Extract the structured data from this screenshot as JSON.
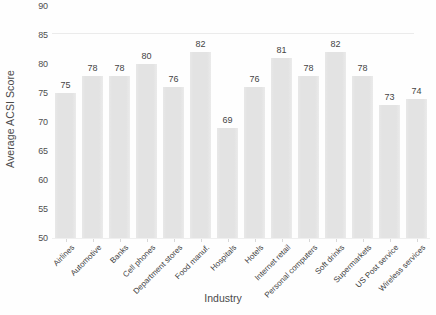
{
  "chart_data": {
    "type": "bar",
    "title": "",
    "xlabel": "Industry",
    "ylabel": "Average ACSI Score",
    "ylim": [
      50,
      90
    ],
    "yticks": [
      50,
      55,
      60,
      65,
      70,
      75,
      80,
      85,
      90
    ],
    "grid": false,
    "legend": null,
    "bar_color": "#e3e3e3",
    "data_labels": true,
    "xtick_rotation": -45,
    "categories": [
      "Airlines",
      "Automotive",
      "Banks",
      "Cell phones",
      "Department stores",
      "Food manuf.",
      "Hospitals",
      "Hotels",
      "Internet retail",
      "Personal computers",
      "Soft drinks",
      "Supermarkets",
      "US Post service",
      "Wireless services"
    ],
    "values": [
      75,
      78,
      78,
      80,
      76,
      82,
      69,
      76,
      81,
      78,
      82,
      78,
      73,
      74
    ]
  }
}
